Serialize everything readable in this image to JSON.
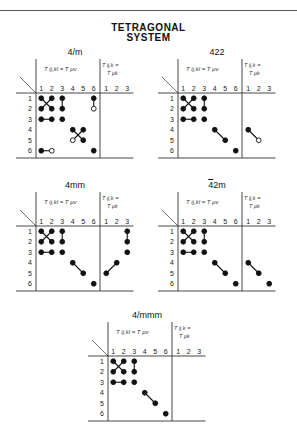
{
  "header_text": "",
  "title": {
    "line1": "TETRAGONAL",
    "line2": "SYSTEM"
  },
  "col_headers": [
    "1",
    "2",
    "3",
    "4",
    "5",
    "6",
    "1",
    "2",
    "3"
  ],
  "row_headers": [
    "1",
    "2",
    "3",
    "4",
    "5",
    "6"
  ],
  "left_header": "T ij,kl = T μν",
  "right_header": "T ij,k = T μk",
  "panels": [
    {
      "label": "4/m",
      "x": 10,
      "y": 47,
      "dots": [
        [
          1,
          1,
          "f"
        ],
        [
          1,
          2,
          "f"
        ],
        [
          1,
          3,
          "f"
        ],
        [
          1,
          6,
          "f"
        ],
        [
          2,
          1,
          "f"
        ],
        [
          2,
          2,
          "f"
        ],
        [
          2,
          3,
          "f"
        ],
        [
          2,
          6,
          "o"
        ],
        [
          3,
          1,
          "f"
        ],
        [
          3,
          2,
          "f"
        ],
        [
          3,
          3,
          "f"
        ],
        [
          4,
          4,
          "f"
        ],
        [
          4,
          5,
          "f"
        ],
        [
          5,
          4,
          "o"
        ],
        [
          5,
          5,
          "f"
        ],
        [
          6,
          1,
          "f"
        ],
        [
          6,
          2,
          "o"
        ],
        [
          6,
          6,
          "f"
        ]
      ],
      "lines": [
        [
          1,
          1,
          2,
          2
        ],
        [
          1,
          2,
          2,
          1
        ],
        [
          1,
          3,
          2,
          3
        ],
        [
          1,
          6,
          2,
          6
        ],
        [
          3,
          1,
          3,
          2
        ],
        [
          4,
          4,
          5,
          5
        ],
        [
          4,
          5,
          5,
          4
        ],
        [
          6,
          1,
          6,
          2
        ]
      ]
    },
    {
      "label": "422",
      "x": 152,
      "y": 47,
      "dots": [
        [
          1,
          1,
          "f"
        ],
        [
          1,
          2,
          "f"
        ],
        [
          1,
          3,
          "f"
        ],
        [
          2,
          1,
          "f"
        ],
        [
          2,
          2,
          "f"
        ],
        [
          2,
          3,
          "f"
        ],
        [
          3,
          1,
          "f"
        ],
        [
          3,
          2,
          "f"
        ],
        [
          3,
          3,
          "f"
        ],
        [
          4,
          4,
          "f"
        ],
        [
          5,
          5,
          "f"
        ],
        [
          6,
          6,
          "f"
        ],
        [
          4,
          7,
          "f"
        ],
        [
          5,
          8,
          "o"
        ]
      ],
      "lines": [
        [
          1,
          1,
          2,
          2
        ],
        [
          1,
          2,
          2,
          1
        ],
        [
          1,
          3,
          2,
          3
        ],
        [
          3,
          1,
          3,
          2
        ],
        [
          4,
          4,
          5,
          5
        ],
        [
          4,
          7,
          5,
          8
        ]
      ]
    },
    {
      "label": "4mm",
      "x": 10,
      "y": 180,
      "dots": [
        [
          1,
          1,
          "f"
        ],
        [
          1,
          2,
          "f"
        ],
        [
          1,
          3,
          "f"
        ],
        [
          2,
          1,
          "f"
        ],
        [
          2,
          2,
          "f"
        ],
        [
          2,
          3,
          "f"
        ],
        [
          3,
          1,
          "f"
        ],
        [
          3,
          2,
          "f"
        ],
        [
          3,
          3,
          "f"
        ],
        [
          4,
          4,
          "f"
        ],
        [
          5,
          5,
          "f"
        ],
        [
          6,
          6,
          "f"
        ],
        [
          1,
          9,
          "f"
        ],
        [
          2,
          9,
          "f"
        ],
        [
          3,
          9,
          "f"
        ],
        [
          4,
          8,
          "f"
        ],
        [
          5,
          7,
          "f"
        ]
      ],
      "lines": [
        [
          1,
          1,
          2,
          2
        ],
        [
          1,
          2,
          2,
          1
        ],
        [
          1,
          3,
          2,
          3
        ],
        [
          3,
          1,
          3,
          2
        ],
        [
          4,
          4,
          5,
          5
        ],
        [
          1,
          9,
          2,
          9
        ],
        [
          4,
          8,
          5,
          7
        ]
      ]
    },
    {
      "label": "42m",
      "overbar": true,
      "x": 152,
      "y": 180,
      "dots": [
        [
          1,
          1,
          "f"
        ],
        [
          1,
          2,
          "f"
        ],
        [
          1,
          3,
          "f"
        ],
        [
          2,
          1,
          "f"
        ],
        [
          2,
          2,
          "f"
        ],
        [
          2,
          3,
          "f"
        ],
        [
          3,
          1,
          "f"
        ],
        [
          3,
          2,
          "f"
        ],
        [
          3,
          3,
          "f"
        ],
        [
          4,
          4,
          "f"
        ],
        [
          5,
          5,
          "f"
        ],
        [
          6,
          6,
          "f"
        ],
        [
          4,
          7,
          "f"
        ],
        [
          5,
          8,
          "f"
        ],
        [
          6,
          9,
          "f"
        ]
      ],
      "lines": [
        [
          1,
          1,
          2,
          2
        ],
        [
          1,
          2,
          2,
          1
        ],
        [
          1,
          3,
          2,
          3
        ],
        [
          3,
          1,
          3,
          2
        ],
        [
          4,
          4,
          5,
          5
        ],
        [
          4,
          7,
          5,
          8
        ]
      ]
    },
    {
      "label": "4/mmm",
      "x": 82,
      "y": 310,
      "dots": [
        [
          1,
          1,
          "f"
        ],
        [
          1,
          2,
          "f"
        ],
        [
          1,
          3,
          "f"
        ],
        [
          2,
          1,
          "f"
        ],
        [
          2,
          2,
          "f"
        ],
        [
          2,
          3,
          "f"
        ],
        [
          3,
          1,
          "f"
        ],
        [
          3,
          2,
          "f"
        ],
        [
          3,
          3,
          "f"
        ],
        [
          4,
          4,
          "f"
        ],
        [
          5,
          5,
          "f"
        ],
        [
          6,
          6,
          "f"
        ]
      ],
      "lines": [
        [
          1,
          1,
          2,
          2
        ],
        [
          1,
          2,
          2,
          1
        ],
        [
          1,
          3,
          2,
          3
        ],
        [
          3,
          1,
          3,
          2
        ],
        [
          4,
          4,
          5,
          5
        ]
      ]
    }
  ]
}
